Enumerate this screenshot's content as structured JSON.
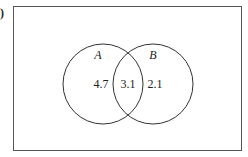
{
  "figure": {
    "part_marker": ")",
    "universe": {
      "x": 13,
      "y": 6,
      "width": 229,
      "height": 145
    },
    "sets": [
      {
        "name": "A",
        "label_x": 98,
        "label_y": 58,
        "cx": 103,
        "cy": 84,
        "r": 40
      },
      {
        "name": "B",
        "label_x": 152,
        "label_y": 58,
        "cx": 153,
        "cy": 84,
        "r": 40
      }
    ],
    "regions": [
      {
        "id": "A-only",
        "value": "4.7",
        "x": 101,
        "y": 88
      },
      {
        "id": "A-and-B",
        "value": "3.1",
        "x": 128,
        "y": 88
      },
      {
        "id": "B-only",
        "value": "2.1",
        "x": 155,
        "y": 88
      }
    ],
    "colors": {
      "stroke": "#333333",
      "text": "#222222",
      "background": "#ffffff"
    }
  }
}
